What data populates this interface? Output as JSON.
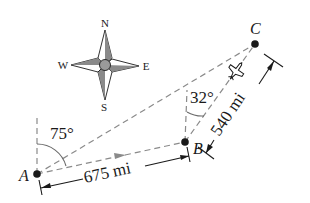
{
  "diagram": {
    "type": "navigation bearing diagram",
    "points": {
      "A": {
        "label": "A",
        "x": 37,
        "y": 174
      },
      "B": {
        "label": "B",
        "x": 185,
        "y": 142
      },
      "C": {
        "label": "C",
        "x": 255,
        "y": 44
      }
    },
    "compass": {
      "north": "N",
      "south": "S",
      "east": "E",
      "west": "W"
    },
    "angles": {
      "at_A": "75°",
      "at_B": "32°"
    },
    "distances": {
      "AB": "675 mi",
      "BC": "540 mi"
    },
    "colors": {
      "ink": "#1a1a1a",
      "dashed_line": "#8a8a8a",
      "compass_fill": "#7a7a7a",
      "direction_arrow": "#8a8a8a"
    },
    "icons": {
      "plane": "airplane-icon",
      "compass": "compass-rose-icon"
    }
  }
}
